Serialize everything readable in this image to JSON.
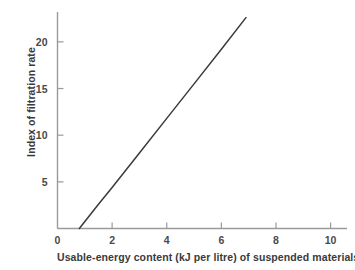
{
  "chart_data": {
    "type": "line",
    "title": "",
    "subtitle": "",
    "xlabel": "Usable-energy content (kJ per litre) of suspended materials",
    "ylabel": "Index of filtration rate",
    "xlim": [
      0,
      10.6
    ],
    "ylim": [
      0,
      23.2
    ],
    "xticks": [
      0,
      2,
      4,
      6,
      8,
      10
    ],
    "xtick_labels": [
      "0",
      "2",
      "4",
      "6",
      "8",
      "10"
    ],
    "yticks": [
      5,
      10,
      15,
      20
    ],
    "ytick_labels": [
      "5",
      "10",
      "15",
      "20"
    ],
    "grid": false,
    "legend": null,
    "legend_position": "none",
    "annotations": [],
    "series": [
      {
        "name": "Index of filtration rate",
        "type": "line",
        "color": "#3a3a3a",
        "line_width": 1.5,
        "x": [
          0.8,
          1.5,
          2.0,
          3.0,
          4.0,
          5.0,
          6.0,
          6.9
        ],
        "values": [
          0.0,
          2.6,
          4.4,
          8.1,
          11.8,
          15.5,
          19.2,
          22.6
        ],
        "x_intercept": 0.8,
        "slope": 3.7
      }
    ]
  },
  "axes": {
    "axis_color": "#9a9a9a",
    "tick_color": "#9a9a9a",
    "text_color": "#3a3a3a",
    "background": "#ffffff"
  }
}
